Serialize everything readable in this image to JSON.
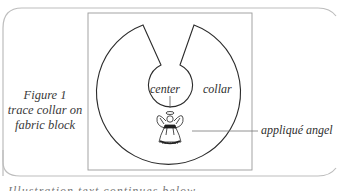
{
  "figure": {
    "caption": {
      "lines": [
        "Figure 1",
        "trace collar on",
        "fabric block"
      ]
    },
    "labels": {
      "center": "center",
      "collar": "collar",
      "applique": "appliqué angel"
    },
    "cutoff_text": "Illustration text continues below",
    "colors": {
      "frame": "#b8b8b8",
      "block": "#8a8a8a",
      "outline": "#2a2a2a",
      "text": "#333333"
    }
  }
}
